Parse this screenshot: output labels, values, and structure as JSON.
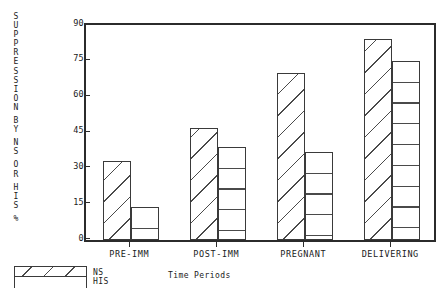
{
  "chart_data": {
    "type": "bar",
    "title": "",
    "subtitle": "",
    "xlabel": "Time Periods",
    "ylabel": "SUPPRESSION BY NS OR HIS %",
    "categories": [
      "PRE-IMM",
      "POST-IMM",
      "PREGNANT",
      "DELIVERING"
    ],
    "series": [
      {
        "name": "NS",
        "values": [
          33,
          47,
          70,
          84
        ],
        "pattern": "diagonal-hatch"
      },
      {
        "name": "HIS",
        "values": [
          14,
          39,
          37,
          75
        ],
        "pattern": "horizontal-lines"
      }
    ],
    "ylim": [
      0,
      90
    ],
    "yticks": [
      0,
      15,
      30,
      45,
      60,
      75,
      90
    ],
    "ytick_labels": [
      "0",
      "15",
      "30",
      "45",
      "60",
      "75",
      "90"
    ],
    "grid": false,
    "legend_position": "bottom-left",
    "legend_entries": [
      "NS",
      "HIS"
    ],
    "frame": "box",
    "colors": {
      "axis": "#2b2b2b",
      "bar_outline": "#3a3a3a",
      "hatch": "#4a4a4a",
      "bar_fill": "#ffffff",
      "background": "#ffffff",
      "text": "#1a1a1a"
    }
  },
  "ylabel_chars": [
    "S",
    "U",
    "P",
    "P",
    "R",
    "E",
    "S",
    "S",
    "I",
    "O",
    "N",
    "",
    "B",
    "Y",
    "",
    "N",
    "S",
    "",
    "O",
    "R",
    "",
    "H",
    "I",
    "S",
    "",
    "%"
  ],
  "legend": {
    "ns_label": "NS",
    "his_label": "HIS"
  }
}
